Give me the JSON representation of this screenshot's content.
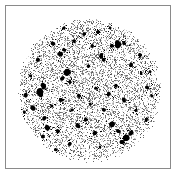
{
  "image": {
    "kind": "scientific-plate",
    "width_px": 177,
    "height_px": 178,
    "background_color": "#ffffff",
    "caption": "",
    "title": ""
  },
  "frame": {
    "name": "plate-border",
    "left_px": 5,
    "top_px": 5,
    "width_px": 166,
    "height_px": 164,
    "border_width_px": 1,
    "border_color": "#8a8a8a",
    "fill_color": "#ffffff"
  },
  "field": {
    "name": "circular-speckle-field",
    "shape": "circle",
    "center_x_px": 89,
    "center_y_px": 90,
    "radius_px": 73,
    "edge_softness_px": 6,
    "ink_color": "#000000",
    "paper_color": "#ffffff",
    "description": "dense monochrome speckle grain filling a circular aperture, with scattered darker clumps"
  },
  "texture": {
    "random_seed": 20240517,
    "grain_cell_px": 1,
    "grain_fill_fraction": 0.34,
    "grain_min_gray": 96,
    "grain_max_gray": 232,
    "midtone_fill_fraction": 0.1,
    "midtone_gray": 64,
    "radial_density_falloff": 0.35
  },
  "blobs": {
    "count": 58,
    "min_radius_px": 1.2,
    "max_radius_px": 4.2,
    "color": "#000000",
    "clumpiness": 0.6,
    "positions": [
      {
        "x": 40,
        "y": 92,
        "r": 4.0
      },
      {
        "x": 44,
        "y": 86,
        "r": 2.6
      },
      {
        "x": 67,
        "y": 72,
        "r": 3.6
      },
      {
        "x": 63,
        "y": 78,
        "r": 2.2
      },
      {
        "x": 70,
        "y": 82,
        "r": 2.0
      },
      {
        "x": 118,
        "y": 44,
        "r": 3.2
      },
      {
        "x": 124,
        "y": 43,
        "r": 2.0
      },
      {
        "x": 112,
        "y": 46,
        "r": 1.8
      },
      {
        "x": 60,
        "y": 54,
        "r": 2.8
      },
      {
        "x": 64,
        "y": 50,
        "r": 1.8
      },
      {
        "x": 101,
        "y": 56,
        "r": 2.6
      },
      {
        "x": 104,
        "y": 60,
        "r": 1.8
      },
      {
        "x": 53,
        "y": 44,
        "r": 2.2
      },
      {
        "x": 84,
        "y": 34,
        "r": 2.0
      },
      {
        "x": 98,
        "y": 32,
        "r": 1.8
      },
      {
        "x": 74,
        "y": 41,
        "r": 1.6
      },
      {
        "x": 131,
        "y": 65,
        "r": 2.0
      },
      {
        "x": 141,
        "y": 74,
        "r": 1.8
      },
      {
        "x": 147,
        "y": 88,
        "r": 2.2
      },
      {
        "x": 152,
        "y": 96,
        "r": 1.6
      },
      {
        "x": 30,
        "y": 76,
        "r": 1.8
      },
      {
        "x": 26,
        "y": 96,
        "r": 2.0
      },
      {
        "x": 33,
        "y": 108,
        "r": 2.4
      },
      {
        "x": 44,
        "y": 118,
        "r": 2.0
      },
      {
        "x": 48,
        "y": 128,
        "r": 2.6
      },
      {
        "x": 43,
        "y": 136,
        "r": 2.2
      },
      {
        "x": 58,
        "y": 131,
        "r": 1.8
      },
      {
        "x": 77,
        "y": 126,
        "r": 2.4
      },
      {
        "x": 86,
        "y": 120,
        "r": 2.0
      },
      {
        "x": 95,
        "y": 133,
        "r": 2.2
      },
      {
        "x": 112,
        "y": 124,
        "r": 2.6
      },
      {
        "x": 118,
        "y": 131,
        "r": 2.0
      },
      {
        "x": 126,
        "y": 137,
        "r": 3.0
      },
      {
        "x": 131,
        "y": 133,
        "r": 2.0
      },
      {
        "x": 122,
        "y": 142,
        "r": 1.8
      },
      {
        "x": 104,
        "y": 110,
        "r": 1.8
      },
      {
        "x": 90,
        "y": 104,
        "r": 1.6
      },
      {
        "x": 79,
        "y": 96,
        "r": 1.8
      },
      {
        "x": 72,
        "y": 110,
        "r": 1.6
      },
      {
        "x": 61,
        "y": 100,
        "r": 1.8
      },
      {
        "x": 52,
        "y": 106,
        "r": 1.6
      },
      {
        "x": 109,
        "y": 94,
        "r": 2.0
      },
      {
        "x": 116,
        "y": 86,
        "r": 1.6
      },
      {
        "x": 124,
        "y": 100,
        "r": 1.8
      },
      {
        "x": 136,
        "y": 110,
        "r": 1.6
      },
      {
        "x": 96,
        "y": 88,
        "r": 1.6
      },
      {
        "x": 88,
        "y": 66,
        "r": 1.8
      },
      {
        "x": 92,
        "y": 46,
        "r": 1.6
      },
      {
        "x": 70,
        "y": 144,
        "r": 1.8
      },
      {
        "x": 100,
        "y": 147,
        "r": 1.6
      },
      {
        "x": 38,
        "y": 60,
        "r": 1.6
      },
      {
        "x": 140,
        "y": 55,
        "r": 1.6
      },
      {
        "x": 56,
        "y": 150,
        "r": 1.4
      },
      {
        "x": 146,
        "y": 120,
        "r": 1.4
      },
      {
        "x": 24,
        "y": 112,
        "r": 1.4
      },
      {
        "x": 64,
        "y": 28,
        "r": 1.4
      },
      {
        "x": 110,
        "y": 28,
        "r": 1.4
      },
      {
        "x": 150,
        "y": 72,
        "r": 1.4
      }
    ]
  }
}
